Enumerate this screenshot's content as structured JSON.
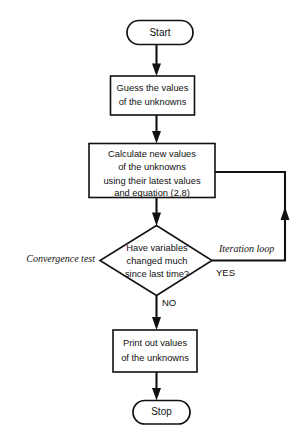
{
  "diagram": {
    "type": "flowchart",
    "orientation": "top-to-bottom",
    "nodes": {
      "start": {
        "shape": "terminator",
        "label": "Start"
      },
      "guess": {
        "shape": "process",
        "lines": [
          "Guess the values",
          "of the unknowns"
        ]
      },
      "calculate": {
        "shape": "process",
        "lines": [
          "Calculate new values",
          "of the unknowns",
          "using their latest values",
          "and equation (2.8)"
        ]
      },
      "decision": {
        "shape": "decision",
        "lines": [
          "Have variables",
          "changed much",
          "since last time?"
        ]
      },
      "print": {
        "shape": "process",
        "lines": [
          "Print out values",
          "of the unknowns"
        ]
      },
      "stop": {
        "shape": "terminator",
        "label": "Stop"
      }
    },
    "branch_labels": {
      "yes": "YES",
      "no": "NO"
    },
    "annotations": {
      "convergence_test": "Convergence test",
      "iteration_loop": "Iteration loop"
    },
    "colors": {
      "stroke": "#111111",
      "fill": "#ffffff",
      "background": "#ffffff"
    }
  }
}
